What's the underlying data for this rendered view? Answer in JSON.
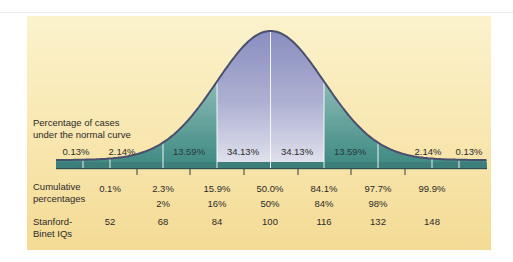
{
  "chart_data": {
    "type": "area",
    "title": "Percentage of cases under the normal curve",
    "xlabel": "",
    "ylabel": "",
    "grid": false,
    "sigma_positions": [
      -3,
      -2,
      -1,
      0,
      1,
      2,
      3
    ],
    "segments": [
      {
        "range": "< -3σ",
        "label": "0.13%"
      },
      {
        "range": "-3σ to -2σ",
        "label": "2.14%"
      },
      {
        "range": "-2σ to -1σ",
        "label": "13.59%"
      },
      {
        "range": "-1σ to 0",
        "label": "34.13%"
      },
      {
        "range": "0 to +1σ",
        "label": "34.13%"
      },
      {
        "range": "+1σ to +2σ",
        "label": "13.59%"
      },
      {
        "range": "+2σ to +3σ",
        "label": "2.14%"
      },
      {
        "range": "> +3σ",
        "label": "0.13%"
      }
    ],
    "rows": [
      {
        "name": "Cumulative percentages",
        "values": [
          "0.1%",
          "2.3%",
          "15.9%",
          "50.0%",
          "84.1%",
          "97.7%",
          "99.9%"
        ]
      },
      {
        "name": "Cumulative percentages (rounded)",
        "values": [
          "",
          "2%",
          "16%",
          "50%",
          "84%",
          "98%",
          ""
        ]
      },
      {
        "name": "Stanford-Binet IQs",
        "values": [
          52,
          68,
          84,
          100,
          116,
          132,
          148
        ]
      }
    ],
    "colors": {
      "background": "#f8e6ae",
      "center_fill_top": "#8a8fc0",
      "center_fill_bottom": "#e4e5ef",
      "tail_fill_top": "#c2dbd6",
      "tail_fill_bottom": "#3b8a84",
      "outline": "#4b4f6e"
    }
  },
  "labels": {
    "title_line1": "Percentage of cases",
    "title_line2": "under the normal curve",
    "seg": [
      "0.13%",
      "2.14%",
      "13.59%",
      "34.13%",
      "34.13%",
      "13.59%",
      "2.14%",
      "0.13%"
    ],
    "cum_head_1": "Cumulative",
    "cum_head_2": "percentages",
    "cum": [
      "0.1%",
      "2.3%",
      "15.9%",
      "50.0%",
      "84.1%",
      "97.7%",
      "99.9%"
    ],
    "cum_round": [
      "2%",
      "16%",
      "50%",
      "84%",
      "98%"
    ],
    "iq_head_1": "Stanford-",
    "iq_head_2": "Binet IQs",
    "iq": [
      "52",
      "68",
      "84",
      "100",
      "116",
      "132",
      "148"
    ]
  }
}
